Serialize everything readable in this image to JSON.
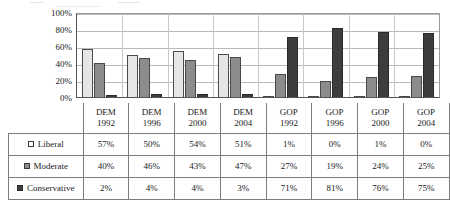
{
  "chart_data": {
    "type": "bar",
    "title": "",
    "xlabel": "",
    "ylabel": "",
    "ylim": [
      0,
      100
    ],
    "grid": true,
    "legend_position": "table-row-headers",
    "categories": [
      "DEM 1992",
      "DEM 1996",
      "DEM 2000",
      "DEM 2004",
      "GOP 1992",
      "GOP 1996",
      "GOP 2000",
      "GOP 2004"
    ],
    "category_lines": [
      {
        "party": "DEM",
        "year": "1992"
      },
      {
        "party": "DEM",
        "year": "1996"
      },
      {
        "party": "DEM",
        "year": "2000"
      },
      {
        "party": "DEM",
        "year": "2004"
      },
      {
        "party": "GOP",
        "year": "1992"
      },
      {
        "party": "GOP",
        "year": "1996"
      },
      {
        "party": "GOP",
        "year": "2000"
      },
      {
        "party": "GOP",
        "year": "2004"
      }
    ],
    "ytick_labels": [
      "100%",
      "80%",
      "60%",
      "40%",
      "20%",
      "0%"
    ],
    "ytick_values": [
      100,
      80,
      60,
      40,
      20,
      0
    ],
    "series": [
      {
        "name": "Liberal",
        "color": "#e6e6e6",
        "values": [
          57,
          50,
          54,
          51,
          1,
          0,
          1,
          0
        ],
        "labels": [
          "57%",
          "50%",
          "54%",
          "51%",
          "1%",
          "0%",
          "1%",
          "0%"
        ]
      },
      {
        "name": "Moderate",
        "color": "#8c8c8c",
        "values": [
          40,
          46,
          43,
          47,
          27,
          19,
          24,
          25
        ],
        "labels": [
          "40%",
          "46%",
          "43%",
          "47%",
          "27%",
          "19%",
          "24%",
          "25%"
        ]
      },
      {
        "name": "Conservative",
        "color": "#3d3d3d",
        "values": [
          2,
          4,
          4,
          3,
          71,
          81,
          76,
          75
        ],
        "labels": [
          "2%",
          "4%",
          "4%",
          "3%",
          "71%",
          "81%",
          "76%",
          "75%"
        ]
      }
    ]
  },
  "table": {
    "corner_label": "",
    "row_header_key": "name",
    "rows": [
      {
        "label": "Liberal",
        "swatch": "legend-swatch-liberal"
      },
      {
        "label": "Moderate",
        "swatch": "legend-swatch-moderate"
      },
      {
        "label": "Conservative",
        "swatch": "legend-swatch-conservative"
      }
    ]
  }
}
